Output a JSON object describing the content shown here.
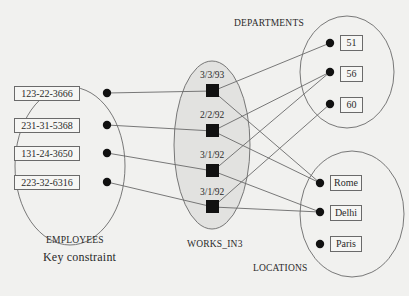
{
  "diagram": {
    "caption": "Key constraint",
    "entity_sets": {
      "employees": {
        "label": "EMPLOYEES",
        "members": [
          "123-22-3666",
          "231-31-5368",
          "131-24-3650",
          "223-32-6316"
        ]
      },
      "departments": {
        "label": "DEPARTMENTS",
        "members": [
          "51",
          "56",
          "60"
        ]
      },
      "locations": {
        "label": "LOCATIONS",
        "members": [
          "Rome",
          "Delhi",
          "Paris"
        ]
      }
    },
    "relationship_set": {
      "label": "WORKS_IN3",
      "instances": [
        {
          "since": "3/3/93",
          "employee": "123-22-3666",
          "department": "51",
          "location": "Rome"
        },
        {
          "since": "2/2/92",
          "employee": "231-31-5368",
          "department": "56",
          "location": "Rome"
        },
        {
          "since": "3/1/92",
          "employee": "131-24-3650",
          "department": "56",
          "location": "Delhi"
        },
        {
          "since": "3/1/92",
          "employee": "223-32-6316",
          "department": "60",
          "location": "Delhi"
        }
      ]
    },
    "colors": {
      "background": "#f1f1ef",
      "relationship_fill": "#e2e2e0",
      "stroke": "#6a6a6a",
      "node": "#111111"
    }
  }
}
